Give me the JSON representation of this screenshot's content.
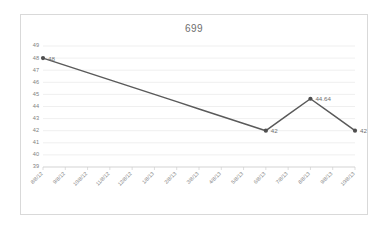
{
  "chart_data": {
    "type": "line",
    "title": "699",
    "xlabel": "",
    "ylabel": "",
    "ylim": [
      39,
      49
    ],
    "ytick_labels": [
      "49",
      "48",
      "47",
      "46",
      "45",
      "44",
      "43",
      "42",
      "41",
      "40",
      "39"
    ],
    "ytick_values": [
      49,
      48,
      47,
      46,
      45,
      44,
      43,
      42,
      41,
      40,
      39
    ],
    "grid": true,
    "legend": false,
    "categories": [
      "8/8/12",
      "9/8/12",
      "10/8/12",
      "11/8/12",
      "12/8/12",
      "1/8/13",
      "2/8/13",
      "3/8/13",
      "4/8/13",
      "5/8/13",
      "6/8/13",
      "7/8/13",
      "8/8/13",
      "9/8/13",
      "10/8/13"
    ],
    "values": [
      48,
      47.4,
      46.8,
      46.2,
      45.6,
      45,
      44.4,
      43.8,
      43.2,
      42.6,
      42,
      43.32,
      44.64,
      43.32,
      42
    ],
    "point_labels": [
      {
        "index": 0,
        "text": "48"
      },
      {
        "index": 10,
        "text": "42"
      },
      {
        "index": 12,
        "text": "44.64"
      },
      {
        "index": 14,
        "text": "42"
      }
    ],
    "colors": {
      "line": "#5a5a5a",
      "marker": "#4f4f4f",
      "gridline": "#e4e4e4",
      "axis": "#cfcfcf",
      "tick_text": "#808080",
      "title_text": "#6e6e6e",
      "border": "#d9d9d9"
    }
  }
}
